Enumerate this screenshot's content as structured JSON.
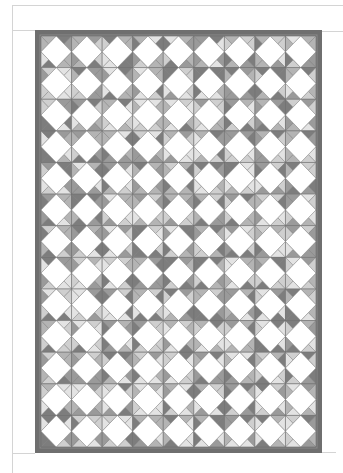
{
  "page": {
    "width": 343,
    "height": 473,
    "background": "#ffffff"
  },
  "frame_lines": [
    {
      "name": "top-frame-line",
      "x": 12,
      "y": 5,
      "w": 331,
      "h": 1
    },
    {
      "name": "header-frame-line",
      "x": 12,
      "y": 30,
      "w": 23,
      "h": 1
    },
    {
      "name": "header-frame-line-right",
      "x": 322,
      "y": 31,
      "w": 21,
      "h": 1
    },
    {
      "name": "left-frame-line",
      "x": 12,
      "y": 5,
      "w": 1,
      "h": 468
    },
    {
      "name": "bottom-frame-line",
      "x": 12,
      "y": 453,
      "w": 23,
      "h": 1
    },
    {
      "name": "bottom-frame-line-right",
      "x": 322,
      "y": 452,
      "w": 14,
      "h": 1
    }
  ],
  "quilt": {
    "outer": {
      "x": 35,
      "y": 30,
      "w": 287,
      "h": 423
    },
    "border_width": 6,
    "border_color": "#6f6f6f",
    "border_inner_color": "#8a8a8a",
    "columns": 9,
    "rows": 13,
    "diamond_color": "#ffffff",
    "seam_color": "#8c8c8c",
    "shades": [
      "#7d7d7d",
      "#9a9a9a",
      "#b4b4b4",
      "#cfcfcf",
      "#e3e3e3"
    ],
    "seed": 7
  }
}
